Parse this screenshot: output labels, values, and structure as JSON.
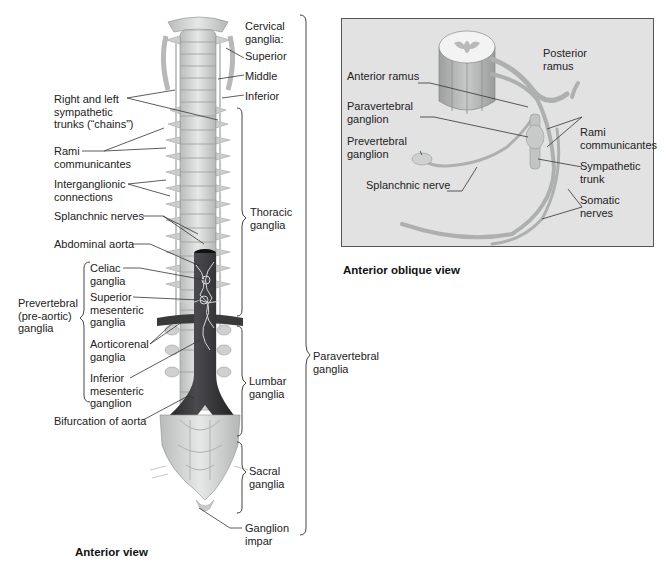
{
  "figure": {
    "left_view": {
      "caption": "Anterior view",
      "labels": {
        "cervical_ganglia": "Cervical\nganglia:",
        "superior": "Superior",
        "middle": "Middle",
        "inferior": "Inferior",
        "sympathetic_trunks": "Right and left\nsympathetic\ntrunks (“chains”)",
        "rami_communicantes": "Rami\ncommunicantes",
        "interganglionic": "Interganglionic\nconnections",
        "splanchnic_nerves": "Splanchnic nerves",
        "abdominal_aorta": "Abdominal aorta",
        "celiac_ganglia": "Celiac\nganglia",
        "superior_mesenteric": "Superior\nmesenteric\nganglia",
        "prevertebral_group": "Prevertebral\n(pre-aortic)\nganglia",
        "aorticorenal": "Aorticorenal\nganglia",
        "inferior_mesenteric": "Inferior\nmesenteric\nganglion",
        "bifurcation": "Bifurcation of aorta",
        "thoracic_ganglia": "Thoracic\nganglia",
        "lumbar_ganglia": "Lumbar\nganglia",
        "sacral_ganglia": "Sacral\nganglia",
        "ganglion_impar": "Ganglion\nimpar",
        "paravertebral_ganglia": "Paravertebral\nganglia"
      }
    },
    "right_view": {
      "caption": "Anterior oblique view",
      "labels": {
        "posterior_ramus": "Posterior\nramus",
        "anterior_ramus": "Anterior ramus",
        "paravertebral_ganglion": "Paravertebral\nganglion",
        "prevertebral_ganglion": "Prevertebral\nganglion",
        "rami_communicantes": "Rami\ncommunicantes",
        "sympathetic_trunk": "Sympathetic\ntrunk",
        "splanchnic_nerve": "Splanchnic nerve",
        "somatic_nerves": "Somatic\nnerves"
      }
    },
    "colors": {
      "panel_bg": "#e2e2e2",
      "bone": "#d4d6d4",
      "aorta": "#2c2c2e",
      "leader_line": "#333333"
    }
  }
}
